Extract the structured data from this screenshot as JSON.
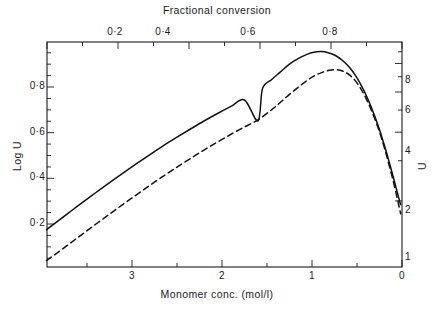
{
  "chart_data": {
    "type": "line",
    "title": "",
    "top_axis": {
      "label": "Fractional conversion",
      "ticks": [
        "0·2",
        "0·4",
        "0·6",
        "0·8"
      ],
      "tick_values": [
        0.2,
        0.4,
        0.6,
        0.8
      ],
      "range": [
        0.0,
        1.0
      ]
    },
    "bottom_axis": {
      "label": "Monomer conc. (mol/l)",
      "ticks": [
        "3",
        "2",
        "1",
        "0"
      ],
      "tick_values": [
        3,
        2,
        1,
        0
      ],
      "range": [
        3.95,
        0.0
      ],
      "direction": "decreasing"
    },
    "left_axis": {
      "label": "Log U",
      "ticks": [
        "0·8",
        "0·6",
        "0·4",
        "0·2"
      ],
      "tick_values": [
        0.8,
        0.6,
        0.4,
        0.2
      ],
      "range": [
        0.0,
        1.0
      ]
    },
    "right_axis": {
      "label": "U",
      "ticks": [
        "8",
        "6",
        "4",
        "2",
        "1"
      ],
      "tick_values": [
        8,
        6,
        4,
        2,
        1
      ],
      "scale": "log",
      "range": [
        1,
        10
      ]
    },
    "grid": false,
    "legend": "none",
    "series": [
      {
        "name": "solid-curve",
        "style": "solid",
        "color": "#111111",
        "points": [
          [
            3.95,
            0.175
          ],
          [
            3.85,
            0.205
          ],
          [
            3.7,
            0.25
          ],
          [
            3.55,
            0.295
          ],
          [
            3.4,
            0.338
          ],
          [
            3.25,
            0.381
          ],
          [
            3.1,
            0.423
          ],
          [
            2.95,
            0.464
          ],
          [
            2.8,
            0.504
          ],
          [
            2.65,
            0.543
          ],
          [
            2.5,
            0.58
          ],
          [
            2.35,
            0.616
          ],
          [
            2.2,
            0.651
          ],
          [
            2.05,
            0.684
          ],
          [
            1.9,
            0.715
          ],
          [
            1.75,
            0.743
          ],
          [
            1.6,
            0.652
          ],
          [
            1.55,
            0.793
          ],
          [
            1.45,
            0.832
          ],
          [
            1.35,
            0.866
          ],
          [
            1.25,
            0.9
          ],
          [
            1.15,
            0.925
          ],
          [
            1.05,
            0.944
          ],
          [
            0.98,
            0.952
          ],
          [
            0.9,
            0.955
          ],
          [
            0.82,
            0.95
          ],
          [
            0.74,
            0.938
          ],
          [
            0.66,
            0.916
          ],
          [
            0.58,
            0.884
          ],
          [
            0.5,
            0.84
          ],
          [
            0.42,
            0.782
          ],
          [
            0.34,
            0.71
          ],
          [
            0.26,
            0.625
          ],
          [
            0.2,
            0.55
          ],
          [
            0.15,
            0.482
          ],
          [
            0.1,
            0.41
          ],
          [
            0.06,
            0.35
          ],
          [
            0.03,
            0.305
          ],
          [
            0.015,
            0.285
          ]
        ]
      },
      {
        "name": "dashed-curve",
        "style": "dashed",
        "color": "#111111",
        "points": [
          [
            3.95,
            0.04
          ],
          [
            3.85,
            0.068
          ],
          [
            3.7,
            0.112
          ],
          [
            3.55,
            0.156
          ],
          [
            3.4,
            0.2
          ],
          [
            3.25,
            0.243
          ],
          [
            3.1,
            0.286
          ],
          [
            2.95,
            0.328
          ],
          [
            2.8,
            0.37
          ],
          [
            2.65,
            0.41
          ],
          [
            2.5,
            0.449
          ],
          [
            2.35,
            0.487
          ],
          [
            2.2,
            0.524
          ],
          [
            2.05,
            0.559
          ],
          [
            1.9,
            0.593
          ],
          [
            1.75,
            0.625
          ],
          [
            1.6,
            0.656
          ],
          [
            1.45,
            0.7
          ],
          [
            1.35,
            0.733
          ],
          [
            1.25,
            0.768
          ],
          [
            1.15,
            0.8
          ],
          [
            1.05,
            0.83
          ],
          [
            0.98,
            0.848
          ],
          [
            0.9,
            0.862
          ],
          [
            0.82,
            0.872
          ],
          [
            0.74,
            0.876
          ],
          [
            0.66,
            0.87
          ],
          [
            0.58,
            0.852
          ],
          [
            0.5,
            0.818
          ],
          [
            0.42,
            0.766
          ],
          [
            0.34,
            0.698
          ],
          [
            0.26,
            0.615
          ],
          [
            0.2,
            0.54
          ],
          [
            0.15,
            0.468
          ],
          [
            0.1,
            0.392
          ],
          [
            0.06,
            0.325
          ],
          [
            0.03,
            0.272
          ],
          [
            0.015,
            0.245
          ]
        ]
      }
    ]
  },
  "axes": {
    "top_title": "Fractional conversion",
    "bottom_title": "Monomer conc. (mol/l)",
    "left_title": "Log U",
    "right_title": "U",
    "top_ticks": [
      {
        "label": "0·2",
        "x": 115
      },
      {
        "label": "0·4",
        "x": 163
      },
      {
        "label": "0·6",
        "x": 248
      },
      {
        "label": "0·8",
        "x": 330
      }
    ],
    "bottom_ticks": [
      {
        "label": "3",
        "x": 132
      },
      {
        "label": "2",
        "x": 222
      },
      {
        "label": "1",
        "x": 312
      },
      {
        "label": "0",
        "x": 402
      }
    ],
    "left_ticks": [
      {
        "label": "0·8",
        "y": 87
      },
      {
        "label": "0·6",
        "y": 133
      },
      {
        "label": "0·4",
        "y": 178
      },
      {
        "label": "0·2",
        "y": 224
      }
    ],
    "right_ticks": [
      {
        "label": "8",
        "y": 81
      },
      {
        "label": "6",
        "y": 111
      },
      {
        "label": "4",
        "y": 152
      },
      {
        "label": "2",
        "y": 211
      },
      {
        "label": "1",
        "y": 258
      }
    ]
  }
}
